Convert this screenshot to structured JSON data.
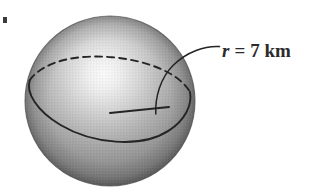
{
  "figure": {
    "kind": "geometry-diagram",
    "background_color": "#ffffff",
    "canvas": {
      "width": 318,
      "height": 194
    }
  },
  "label": {
    "full_text": "r = 7 km",
    "variable": "r",
    "equals": "=",
    "value": "7",
    "unit": "km",
    "value_with_unit": "7 km",
    "color": "#2b2b2b"
  },
  "sphere": {
    "name": "shaded-sphere",
    "center_x": 110,
    "center_y": 101,
    "radius_px": 85,
    "highlight_x": 103,
    "highlight_y": 72,
    "highlight_color": "#f2f2f2",
    "midtone_color": "#9a9a9a",
    "shadow_color": "#565656",
    "edge_color": "#4a4a4a"
  },
  "equator": {
    "name": "great-circle",
    "center_x": 110,
    "center_y": 105,
    "radius_x": 84,
    "radius_y": 30,
    "rotation_deg": -17,
    "back_half_style": "dashed",
    "front_half_style": "solid",
    "stroke_color": "#242424"
  },
  "radius_line": {
    "name": "radius-segment",
    "from_x": 110,
    "from_y": 113,
    "to_x": 169,
    "to_y": 107,
    "style": "solid",
    "stroke_color": "#242424"
  },
  "leader_line": {
    "name": "label-leader",
    "start_x": 218,
    "start_y": 47,
    "end_x": 156,
    "end_y": 113,
    "style": "curved",
    "stroke_color": "#242424"
  },
  "corner_artifact": {
    "name": "scan-artifact",
    "x": 3,
    "y": 17,
    "width": 4,
    "height": 6,
    "color": "#3a3a3a"
  }
}
